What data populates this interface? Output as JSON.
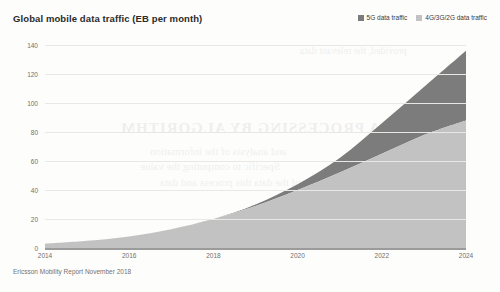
{
  "title": "Global mobile data traffic (EB per month)",
  "source": "Ericsson Mobility Report November 2018",
  "legend": [
    {
      "label": "5G data traffic",
      "color": "#7c7c7c"
    },
    {
      "label": "4G/3G/2G data traffic",
      "color": "#c2c2c2"
    }
  ],
  "ghost_text": {
    "g1": "AT A PROCESSING BY ALGORITHM",
    "g2": "and analysis of the information",
    "g3": "Specific to computing the value",
    "g4": "of the data this process and data",
    "g5": "provided, the  relevant  data",
    "g6": "Algorithm and further data",
    "g7": "and the complexity of Mobile"
  },
  "chart_data": {
    "type": "area",
    "stacked": true,
    "title": "Global mobile data traffic (EB per month)",
    "xlabel": "",
    "ylabel": "EB per month",
    "xlim": [
      2014,
      2024
    ],
    "ylim": [
      0,
      140
    ],
    "yticks": [
      0,
      20,
      40,
      60,
      80,
      100,
      120,
      140
    ],
    "xticks": [
      2014,
      2016,
      2018,
      2020,
      2022,
      2024
    ],
    "grid": true,
    "legend_position": "top-right",
    "x": [
      2014,
      2015,
      2016,
      2017,
      2018,
      2019,
      2020,
      2021,
      2022,
      2023,
      2024
    ],
    "series": [
      {
        "name": "4G/3G/2G data traffic",
        "color": "#c2c2c2",
        "values": [
          3,
          5,
          8,
          13,
          20,
          29,
          40,
          52,
          65,
          78,
          88
        ]
      },
      {
        "name": "5G data traffic",
        "color": "#7c7c7c",
        "values": [
          0,
          0,
          0,
          0,
          0,
          1,
          4,
          10,
          21,
          33,
          48
        ]
      }
    ],
    "totals": [
      3,
      5,
      8,
      13,
      20,
      30,
      44,
      62,
      86,
      111,
      136
    ]
  }
}
